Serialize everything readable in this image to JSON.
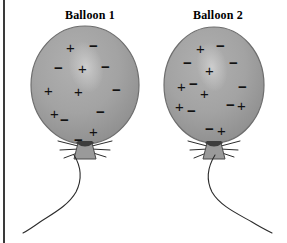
{
  "figure": {
    "background_color": "#ffffff",
    "frame_rule_color": "#3a3a3a",
    "width": 287,
    "height": 243
  },
  "colors": {
    "balloon_fill": "#a3a3a3",
    "balloon_fill_dark": "#8f8f8f",
    "balloon_outline": "#6e6e6e",
    "balloon_highlight": "#c2c2c2",
    "knot_fill": "#9a9a9a",
    "knot_outline": "#4a4a4a",
    "string_color": "#2b2b2b",
    "charge_color": "#111111"
  },
  "balloons": [
    {
      "id": "balloon-1",
      "title": "Balloon 1",
      "title_x": 52,
      "title_y": 8,
      "body": {
        "cx": 85,
        "cy": 85,
        "rx": 54,
        "ry": 59
      },
      "highlight": {
        "cx": 86,
        "cy": 67,
        "rx": 17,
        "ry": 26,
        "rotate": -12
      },
      "knot": {
        "x": 85,
        "y": 146
      },
      "string_path": "M 74 155 C 82 168, 82 180, 76 192 C 68 206, 52 214, 40 222 C 33 227, 27 231, 23 233",
      "whiskers": [
        "M 78 146 L 58 141",
        "M 79 149 L 60 150",
        "M 80 152 L 64 158",
        "M 92 146 L 112 141",
        "M 91 149 L 110 150",
        "M 90 152 L 106 157"
      ],
      "charges": [
        {
          "sign": "+",
          "x": 66,
          "y": 40
        },
        {
          "sign": "−",
          "x": 89,
          "y": 38
        },
        {
          "sign": "−",
          "x": 54,
          "y": 60
        },
        {
          "sign": "+",
          "x": 78,
          "y": 61
        },
        {
          "sign": "−",
          "x": 101,
          "y": 59
        },
        {
          "sign": "+",
          "x": 44,
          "y": 83
        },
        {
          "sign": "+",
          "x": 74,
          "y": 84
        },
        {
          "sign": "−",
          "x": 112,
          "y": 82
        },
        {
          "sign": "+",
          "x": 50,
          "y": 106
        },
        {
          "sign": "−",
          "x": 60,
          "y": 112
        },
        {
          "sign": "−",
          "x": 96,
          "y": 104
        },
        {
          "sign": "+",
          "x": 89,
          "y": 124
        },
        {
          "sign": "−",
          "x": 74,
          "y": 132
        }
      ]
    },
    {
      "id": "balloon-2",
      "title": "Balloon 2",
      "title_x": 180,
      "title_y": 8,
      "body": {
        "cx": 214,
        "cy": 85,
        "rx": 50,
        "ry": 58
      },
      "highlight": {
        "cx": 212,
        "cy": 67,
        "rx": 15,
        "ry": 25,
        "rotate": -10
      },
      "knot": {
        "x": 214,
        "y": 146
      },
      "string_path": "M 215 155 C 207 168, 206 180, 212 192 C 220 206, 238 214, 252 222 C 260 227, 268 231, 272 233",
      "whiskers": [
        "M 207 146 L 188 141",
        "M 208 149 L 190 150",
        "M 209 152 L 194 158",
        "M 221 146 L 240 141",
        "M 220 149 L 238 150",
        "M 219 152 L 234 157"
      ],
      "charges": [
        {
          "sign": "+",
          "x": 196,
          "y": 41
        },
        {
          "sign": "−",
          "x": 216,
          "y": 38
        },
        {
          "sign": "−",
          "x": 183,
          "y": 55
        },
        {
          "sign": "+",
          "x": 205,
          "y": 63
        },
        {
          "sign": "−",
          "x": 229,
          "y": 55
        },
        {
          "sign": "+",
          "x": 177,
          "y": 79
        },
        {
          "sign": "−",
          "x": 189,
          "y": 76
        },
        {
          "sign": "+",
          "x": 200,
          "y": 86
        },
        {
          "sign": "−",
          "x": 238,
          "y": 79
        },
        {
          "sign": "+",
          "x": 175,
          "y": 99
        },
        {
          "sign": "−",
          "x": 187,
          "y": 103
        },
        {
          "sign": "−",
          "x": 226,
          "y": 97
        },
        {
          "sign": "+",
          "x": 237,
          "y": 98
        },
        {
          "sign": "−",
          "x": 205,
          "y": 121
        },
        {
          "sign": "+",
          "x": 217,
          "y": 123
        }
      ]
    }
  ]
}
